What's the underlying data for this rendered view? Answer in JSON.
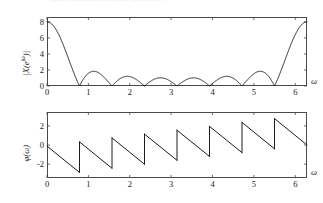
{
  "figure": {
    "background_color": "#ffffff",
    "line_color": "#1c1c1c",
    "axis_color": "#4a4a4a",
    "clipped_caption": "Figure: magnitude and phase of the DTFT"
  },
  "chart_data": [
    {
      "type": "line",
      "id": "magnitude",
      "title": "",
      "xlabel": "ω",
      "ylabel": "|X(e^{jω})|",
      "ylabel_base": "|X(e",
      "ylabel_sup": "jω",
      "ylabel_tail": ")|",
      "xlim": [
        0,
        6.2832
      ],
      "ylim": [
        0,
        8.6
      ],
      "grid": false,
      "legend": false,
      "xticks": [
        0,
        1,
        2,
        3,
        4,
        5,
        6
      ],
      "xticklabels": [
        "0",
        "1",
        "2",
        "3",
        "4",
        "5",
        "6"
      ],
      "yticks": [
        0,
        2,
        4,
        6,
        8
      ],
      "yticklabels": [
        "0",
        "2",
        "4",
        "6",
        "8"
      ],
      "description": "Dirichlet kernel magnitude |sin(4w)/sin(w/2)| for an 8-point rectangular sequence",
      "formula": "abs(sin(8*w/2)/sin(w/2))",
      "N": 8,
      "peak_value": 8,
      "zero_crossings": [
        0.7854,
        1.5708,
        2.3562,
        3.1416,
        3.927,
        4.7124,
        5.4978
      ],
      "sidelobe_peaks": [
        {
          "x": 1.1,
          "y": 1.85
        },
        {
          "x": 1.96,
          "y": 1.0
        },
        {
          "x": 2.75,
          "y": 0.85
        },
        {
          "x": 3.53,
          "y": 0.85
        },
        {
          "x": 4.32,
          "y": 1.0
        },
        {
          "x": 5.18,
          "y": 1.85
        }
      ]
    },
    {
      "type": "line",
      "id": "phase",
      "title": "",
      "xlabel": "ω",
      "ylabel": "φ(ω)",
      "xlim": [
        0,
        6.2832
      ],
      "ylim": [
        -3.45,
        3.45
      ],
      "grid": false,
      "legend": false,
      "xticks": [
        0,
        1,
        2,
        3,
        4,
        5,
        6
      ],
      "xticklabels": [
        "0",
        "1",
        "2",
        "3",
        "4",
        "5",
        "6"
      ],
      "yticks": [
        -2,
        0,
        2
      ],
      "yticklabels": [
        "-2",
        "0",
        "2"
      ],
      "description": "Wrapped phase, sawtooth with negative slope -7/2 and pi jumps at each magnitude zero",
      "formula": "wrap(-3.5*w + pi*floor(w/(pi/4)))",
      "slope": -3.5,
      "segments": [
        {
          "x0": 0.0,
          "y0": -0.12,
          "x1": 0.7854,
          "y1": -2.87
        },
        {
          "x0": 0.7854,
          "y0": 0.32,
          "x1": 1.5708,
          "y1": -2.43
        },
        {
          "x0": 1.5708,
          "y0": 0.74,
          "x1": 2.3562,
          "y1": -2.01
        },
        {
          "x0": 2.3562,
          "y0": 1.14,
          "x1": 3.1416,
          "y1": -1.6
        },
        {
          "x0": 3.1416,
          "y0": 1.55,
          "x1": 3.927,
          "y1": -1.2
        },
        {
          "x0": 3.927,
          "y0": 1.95,
          "x1": 4.7124,
          "y1": -0.8
        },
        {
          "x0": 4.7124,
          "y0": 2.36,
          "x1": 5.4978,
          "y1": -0.4
        },
        {
          "x0": 5.4978,
          "y0": 2.76,
          "x1": 6.2832,
          "y1": 0.0
        }
      ]
    }
  ]
}
